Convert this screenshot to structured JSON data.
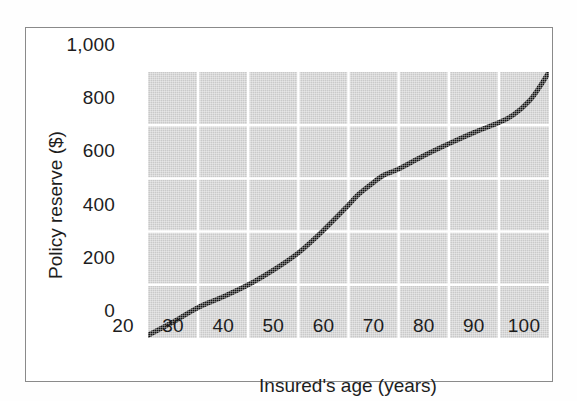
{
  "chart_data": {
    "type": "line",
    "title": "",
    "xlabel": "Insured's age (years)",
    "ylabel": "Policy reserve ($)",
    "xlim": [
      20,
      100
    ],
    "ylim": [
      0,
      1000
    ],
    "xticks": [
      "20",
      "30",
      "40",
      "50",
      "60",
      "70",
      "80",
      "90",
      "100"
    ],
    "xtick_values": [
      20,
      30,
      40,
      50,
      60,
      70,
      80,
      90,
      100
    ],
    "yticks": [
      "0",
      "200",
      "400",
      "600",
      "800",
      "1,000"
    ],
    "ytick_values": [
      0,
      200,
      400,
      600,
      800,
      1000
    ],
    "grid": true,
    "grid_color": "#ffffff",
    "plot_background": "#c9c9c9",
    "legend": null,
    "series": [
      {
        "name": "Policy reserve",
        "color": "#111111",
        "line_width": 5,
        "x": [
          20,
          25,
          30,
          35,
          40,
          45,
          50,
          55,
          60,
          62,
          65,
          67,
          70,
          75,
          80,
          85,
          90,
          93,
          96,
          98,
          100
        ],
        "values": [
          10,
          60,
          115,
          155,
          200,
          255,
          320,
          405,
          500,
          540,
          585,
          612,
          635,
          685,
          730,
          772,
          810,
          840,
          890,
          940,
          1000
        ]
      }
    ]
  },
  "axis": {
    "x_ticks": [
      {
        "label": "20",
        "value": 20
      },
      {
        "label": "30",
        "value": 30
      },
      {
        "label": "40",
        "value": 40
      },
      {
        "label": "50",
        "value": 50
      },
      {
        "label": "60",
        "value": 60
      },
      {
        "label": "70",
        "value": 70
      },
      {
        "label": "80",
        "value": 80
      },
      {
        "label": "90",
        "value": 90
      },
      {
        "label": "100",
        "value": 100
      }
    ],
    "y_ticks": [
      {
        "label": "0",
        "value": 0
      },
      {
        "label": "200",
        "value": 200
      },
      {
        "label": "400",
        "value": 400
      },
      {
        "label": "600",
        "value": 600
      },
      {
        "label": "800",
        "value": 800
      },
      {
        "label": "1,000",
        "value": 1000
      }
    ]
  },
  "colors": {
    "panel": "#c9c9c9",
    "grid": "#ffffff",
    "curve": "#111111",
    "text": "#1d1d1d",
    "frame": "#8a8a8a"
  }
}
